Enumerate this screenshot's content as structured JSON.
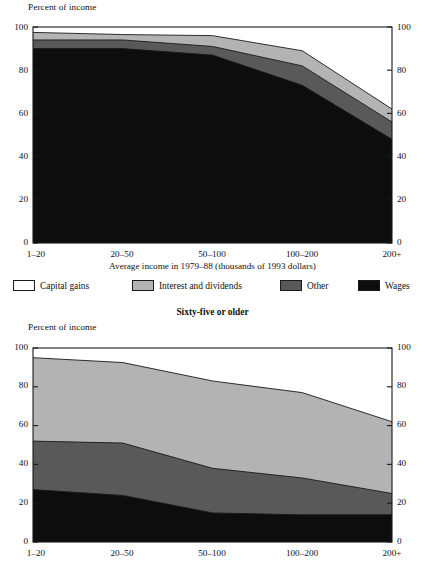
{
  "figure": {
    "panels": [
      {
        "id": "under-sixty-five",
        "title": "",
        "ylabel": "Percent of income"
      },
      {
        "id": "sixty-five-or-older",
        "title": "Sixty-five or older",
        "ylabel": "Percent of income"
      }
    ],
    "xlabel": "Average income in 1979–88 (thousands of 1993 dollars)",
    "legend": [
      {
        "label": "Capital gains",
        "color": "#ffffff",
        "swatch_name": "legend-swatch-capital-gains"
      },
      {
        "label": "Interest and dividends",
        "color": "#b3b3b3",
        "swatch_name": "legend-swatch-interest-and-dividends"
      },
      {
        "label": "Other",
        "color": "#595959",
        "swatch_name": "legend-swatch-other"
      },
      {
        "label": "Wages",
        "color": "#0d0d0d",
        "swatch_name": "legend-swatch-wages"
      }
    ],
    "colors": {
      "capital_gains": "#ffffff",
      "interest_and_dividends": "#b3b3b3",
      "other": "#595959",
      "wages": "#0d0d0d",
      "axis": "#1a1a1a",
      "text": "#111111"
    }
  },
  "chart_data": [
    {
      "type": "area",
      "stacked": true,
      "id": "under-sixty-five",
      "title": "",
      "xlabel": "Average income in 1979–88 (thousands of 1993 dollars)",
      "ylabel": "Percent of income",
      "categories": [
        "1–20",
        "20–50",
        "50–100",
        "100–200",
        "200+"
      ],
      "ylim": [
        0,
        100
      ],
      "yticks": [
        0,
        20,
        40,
        60,
        80,
        100
      ],
      "ytick_labels": [
        "0",
        "20",
        "40",
        "60",
        "80",
        "100"
      ],
      "right_axis": true,
      "grid": false,
      "legend_position": "below",
      "series": [
        {
          "name": "Wages",
          "color": "#0d0d0d",
          "values": [
            90,
            90,
            87,
            73,
            48
          ]
        },
        {
          "name": "Other",
          "color": "#595959",
          "values": [
            4,
            4,
            4,
            9,
            8
          ]
        },
        {
          "name": "Interest and dividends",
          "color": "#b3b3b3",
          "values": [
            3.5,
            2.5,
            5,
            7,
            6
          ]
        },
        {
          "name": "Capital gains",
          "color": "#ffffff",
          "values": [
            2.5,
            3.5,
            4,
            11,
            38
          ]
        }
      ],
      "cumulative": {
        "wages": [
          90,
          90,
          87,
          73,
          48
        ],
        "other": [
          94,
          94,
          91,
          82,
          56
        ],
        "interest_and_dividends": [
          97.5,
          96.5,
          96,
          89,
          62
        ],
        "capital_gains": [
          100,
          100,
          100,
          100,
          100
        ]
      }
    },
    {
      "type": "area",
      "stacked": true,
      "id": "sixty-five-or-older",
      "title": "Sixty-five or older",
      "xlabel": "Average income in 1979–88 (thousands of 1993 dollars)",
      "ylabel": "Percent of income",
      "categories": [
        "1–20",
        "20–50",
        "50–100",
        "100–200",
        "200+"
      ],
      "ylim": [
        0,
        100
      ],
      "yticks": [
        0,
        20,
        40,
        60,
        80,
        100
      ],
      "ytick_labels": [
        "0",
        "20",
        "40",
        "60",
        "80",
        "100"
      ],
      "right_axis": true,
      "grid": false,
      "legend_position": "shared-above",
      "series": [
        {
          "name": "Wages",
          "color": "#0d0d0d",
          "values": [
            27,
            24,
            15,
            14,
            14
          ]
        },
        {
          "name": "Other",
          "color": "#595959",
          "values": [
            25,
            27,
            23,
            19,
            11
          ]
        },
        {
          "name": "Interest and dividends",
          "color": "#b3b3b3",
          "values": [
            43,
            41.5,
            45,
            44,
            37
          ]
        },
        {
          "name": "Capital gains",
          "color": "#ffffff",
          "values": [
            5,
            7.5,
            17,
            23,
            38
          ]
        }
      ],
      "cumulative": {
        "wages": [
          27,
          24,
          15,
          14,
          14
        ],
        "other": [
          52,
          51,
          38,
          33,
          25
        ],
        "interest_and_dividends": [
          95,
          92.5,
          83,
          77,
          62
        ],
        "capital_gains": [
          100,
          100,
          100,
          100,
          100
        ]
      }
    }
  ]
}
